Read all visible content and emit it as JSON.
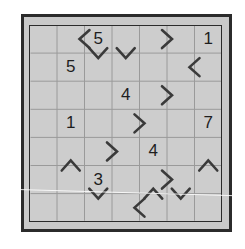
{
  "puzzle": {
    "type": "inequality-number-grid",
    "rows": 7,
    "cols": 7,
    "colors": {
      "background": "#ffffff",
      "board_fill": "#cdcdcd",
      "border": "#2b2b2b",
      "gridline": "#9a9a9a",
      "chevron": "#3a3a3a",
      "digit": "#1e1e1e"
    },
    "clues": [
      {
        "row": 0,
        "col": 2,
        "value": "5"
      },
      {
        "row": 0,
        "col": 6,
        "value": "1"
      },
      {
        "row": 1,
        "col": 1,
        "value": "5"
      },
      {
        "row": 2,
        "col": 3,
        "value": "4"
      },
      {
        "row": 3,
        "col": 1,
        "value": "1"
      },
      {
        "row": 3,
        "col": 6,
        "value": "7"
      },
      {
        "row": 4,
        "col": 4,
        "value": "4"
      },
      {
        "row": 5,
        "col": 2,
        "value": "3"
      }
    ],
    "inequalities": [
      {
        "type": "vertical-edge",
        "row": 0,
        "between_cols": [
          1,
          2
        ],
        "symbol": "<"
      },
      {
        "type": "horizontal-edge",
        "col": 2,
        "between_rows": [
          0,
          1
        ],
        "symbol": "v"
      },
      {
        "type": "horizontal-edge",
        "col": 3,
        "between_rows": [
          0,
          1
        ],
        "symbol": "v"
      },
      {
        "type": "vertical-edge",
        "row": 0,
        "between_cols": [
          4,
          5
        ],
        "symbol": ">"
      },
      {
        "type": "vertical-edge",
        "row": 1,
        "between_cols": [
          5,
          6
        ],
        "symbol": "<"
      },
      {
        "type": "vertical-edge",
        "row": 2,
        "between_cols": [
          4,
          5
        ],
        "symbol": ">"
      },
      {
        "type": "vertical-edge",
        "row": 3,
        "between_cols": [
          3,
          4
        ],
        "symbol": ">"
      },
      {
        "type": "vertical-edge",
        "row": 4,
        "between_cols": [
          2,
          3
        ],
        "symbol": ">"
      },
      {
        "type": "horizontal-edge",
        "col": 1,
        "between_rows": [
          4,
          5
        ],
        "symbol": "^"
      },
      {
        "type": "horizontal-edge",
        "col": 6,
        "between_rows": [
          4,
          5
        ],
        "symbol": "^"
      },
      {
        "type": "horizontal-edge",
        "col": 2,
        "between_rows": [
          5,
          6
        ],
        "symbol": "v"
      },
      {
        "type": "vertical-edge",
        "row": 5,
        "between_cols": [
          4,
          5
        ],
        "symbol": ">"
      },
      {
        "type": "horizontal-edge",
        "col": 4,
        "between_rows": [
          5,
          6
        ],
        "symbol": "^"
      },
      {
        "type": "horizontal-edge",
        "col": 5,
        "between_rows": [
          5,
          6
        ],
        "symbol": "v"
      },
      {
        "type": "vertical-edge",
        "row": 6,
        "between_cols": [
          3,
          4
        ],
        "symbol": "<"
      }
    ]
  }
}
